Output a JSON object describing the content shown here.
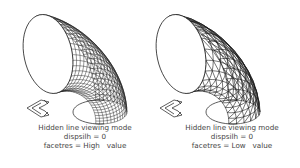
{
  "figures": [
    {
      "id": "high",
      "caption": {
        "line1": "Hidden line viewing mode",
        "line2": "dispsilh = 0",
        "line3": "facetres = High   value"
      },
      "mesh": {
        "rings": 22,
        "segments": 24
      },
      "triangulated": false
    },
    {
      "id": "low",
      "caption": {
        "line1": "Hidden line viewing mode",
        "line2": "dispsilh = 0",
        "line3": "facetres = Low   value"
      },
      "mesh": {
        "rings": 11,
        "segments": 12
      },
      "triangulated": true
    }
  ],
  "colors": {
    "line": "#1a1a1a",
    "text": "#444444",
    "background": "#ffffff"
  }
}
